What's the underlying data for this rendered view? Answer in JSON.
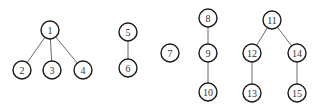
{
  "diagram": {
    "type": "forest",
    "colors": {
      "node_stroke": "#1a1a1a",
      "edge_stroke": "#6b6b6b",
      "label": "#333333",
      "background": "#ffffff"
    },
    "node_radius": 9,
    "nodes": [
      {
        "id": "1",
        "label": "1",
        "x": 50,
        "y": 30
      },
      {
        "id": "2",
        "label": "2",
        "x": 22,
        "y": 70
      },
      {
        "id": "3",
        "label": "3",
        "x": 52,
        "y": 70
      },
      {
        "id": "4",
        "label": "4",
        "x": 83,
        "y": 70
      },
      {
        "id": "5",
        "label": "5",
        "x": 128,
        "y": 32
      },
      {
        "id": "6",
        "label": "6",
        "x": 128,
        "y": 68
      },
      {
        "id": "7",
        "label": "7",
        "x": 170,
        "y": 53
      },
      {
        "id": "8",
        "label": "8",
        "x": 208,
        "y": 18
      },
      {
        "id": "9",
        "label": "9",
        "x": 208,
        "y": 53
      },
      {
        "id": "10",
        "label": "10",
        "x": 208,
        "y": 92
      },
      {
        "id": "11",
        "label": "11",
        "x": 272,
        "y": 20
      },
      {
        "id": "12",
        "label": "12",
        "x": 252,
        "y": 53
      },
      {
        "id": "13",
        "label": "13",
        "x": 252,
        "y": 93
      },
      {
        "id": "14",
        "label": "14",
        "x": 297,
        "y": 53
      },
      {
        "id": "15",
        "label": "15",
        "x": 297,
        "y": 93
      }
    ],
    "edges": [
      {
        "from": "1",
        "to": "2"
      },
      {
        "from": "1",
        "to": "3"
      },
      {
        "from": "1",
        "to": "4"
      },
      {
        "from": "5",
        "to": "6"
      },
      {
        "from": "8",
        "to": "9"
      },
      {
        "from": "9",
        "to": "10"
      },
      {
        "from": "11",
        "to": "12"
      },
      {
        "from": "11",
        "to": "14"
      },
      {
        "from": "12",
        "to": "13"
      },
      {
        "from": "14",
        "to": "15"
      }
    ]
  }
}
